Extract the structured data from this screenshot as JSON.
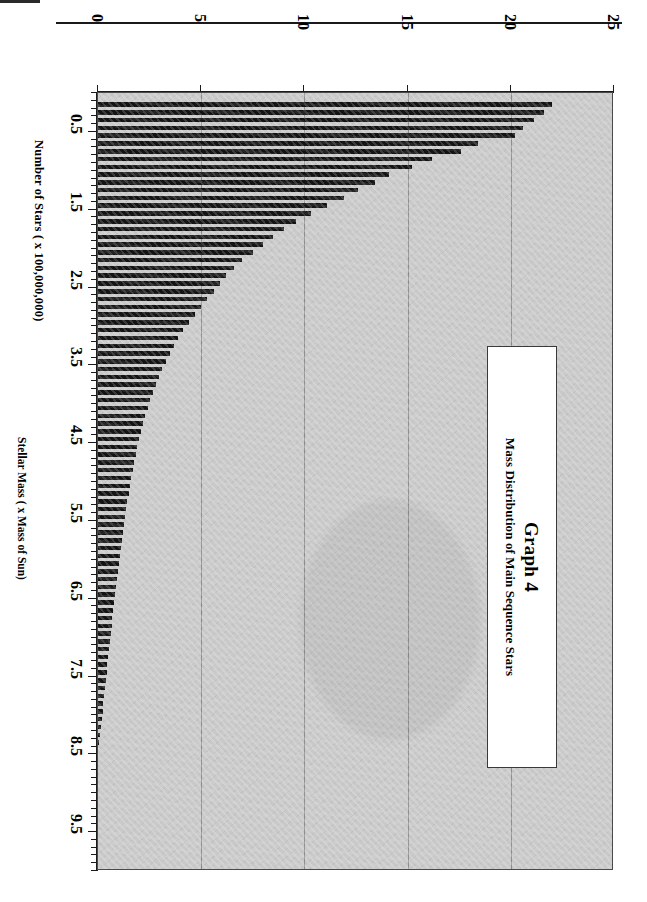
{
  "page": {
    "top_rule": true
  },
  "title_box": {
    "main": "Graph 4",
    "subtitle": "Mass Distribution of Main Sequence Stars"
  },
  "chart_data": {
    "type": "bar",
    "orientation": "horizontal-rotated",
    "title": "Graph 4",
    "subtitle": "Mass Distribution of Main Sequence Stars",
    "xlabel": "Number of Stars ( x 100,000,000)",
    "ylabel": "Stellar Mass ( x Mass of Sun)",
    "xlim": [
      0,
      25
    ],
    "ylim": [
      0,
      10
    ],
    "xticks": [
      0,
      5,
      10,
      15,
      20,
      25
    ],
    "xtick_labels": [
      "0",
      "5",
      "10",
      "15",
      "20",
      "25"
    ],
    "yticks": [
      0.5,
      1.5,
      2.5,
      3.5,
      4.5,
      5.5,
      6.5,
      7.5,
      8.5,
      9.5
    ],
    "ytick_labels": [
      "0.5",
      "1.5",
      "2.5",
      "3.5",
      "4.5",
      "5.5",
      "6.5",
      "7.5",
      "8.5",
      "9.5"
    ],
    "grid": "vertical-only",
    "legend": "none",
    "bar_color": "#141414",
    "plot_bg": "#c9c9c9",
    "categories": [
      0.15,
      0.25,
      0.35,
      0.45,
      0.55,
      0.65,
      0.75,
      0.85,
      0.95,
      1.05,
      1.15,
      1.25,
      1.35,
      1.45,
      1.55,
      1.65,
      1.75,
      1.85,
      1.95,
      2.05,
      2.15,
      2.25,
      2.35,
      2.45,
      2.55,
      2.65,
      2.75,
      2.85,
      2.95,
      3.05,
      3.15,
      3.25,
      3.35,
      3.45,
      3.55,
      3.65,
      3.75,
      3.85,
      3.95,
      4.05,
      4.15,
      4.25,
      4.35,
      4.45,
      4.55,
      4.65,
      4.75,
      4.85,
      4.95,
      5.05,
      5.15,
      5.25,
      5.35,
      5.45,
      5.55,
      5.65,
      5.75,
      5.85,
      5.95,
      6.05,
      6.15,
      6.25,
      6.35,
      6.45,
      6.55,
      6.65,
      6.75,
      6.85,
      6.95,
      7.05,
      7.15,
      7.25,
      7.35,
      7.45,
      7.55,
      7.65,
      7.75,
      7.85,
      7.95,
      8.05,
      8.15,
      8.25,
      8.35
    ],
    "values": [
      22.0,
      21.6,
      21.1,
      20.6,
      20.2,
      18.4,
      17.6,
      16.2,
      15.2,
      14.1,
      13.4,
      12.6,
      11.9,
      11.1,
      10.3,
      9.6,
      9.0,
      8.5,
      8.0,
      7.5,
      7.0,
      6.6,
      6.2,
      5.9,
      5.6,
      5.3,
      5.0,
      4.7,
      4.4,
      4.1,
      3.9,
      3.7,
      3.5,
      3.3,
      3.1,
      2.95,
      2.8,
      2.65,
      2.5,
      2.4,
      2.3,
      2.2,
      2.1,
      2.0,
      1.9,
      1.82,
      1.75,
      1.68,
      1.6,
      1.55,
      1.48,
      1.42,
      1.36,
      1.3,
      1.25,
      1.2,
      1.15,
      1.1,
      1.05,
      1.0,
      0.95,
      0.9,
      0.86,
      0.82,
      0.78,
      0.74,
      0.7,
      0.66,
      0.62,
      0.58,
      0.54,
      0.5,
      0.46,
      0.42,
      0.38,
      0.34,
      0.3,
      0.26,
      0.22,
      0.18,
      0.14,
      0.1,
      0.06
    ]
  }
}
